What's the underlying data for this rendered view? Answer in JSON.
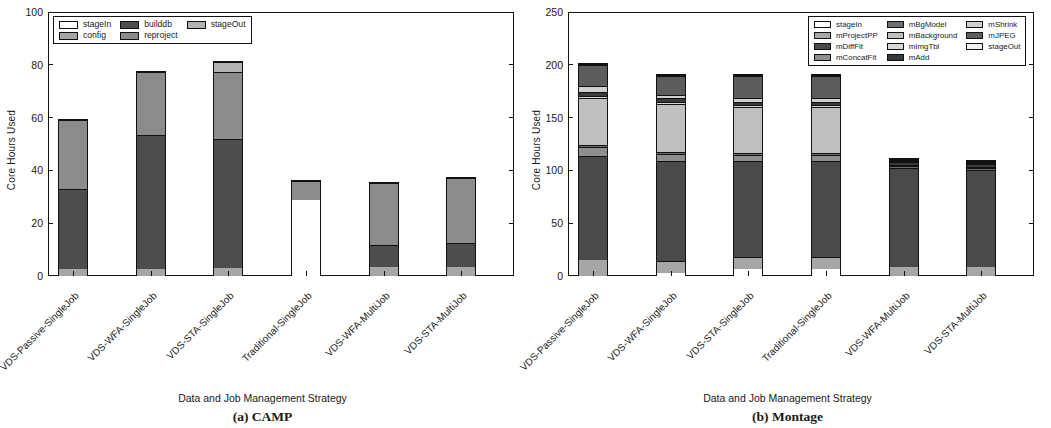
{
  "figure": {
    "panels": [
      {
        "caption": "(a) CAMP",
        "ylabel": "Core Hours Used",
        "xlabel": "Data and Job Management Strategy",
        "yticks": [
          "0",
          "20",
          "40",
          "60",
          "80",
          "100"
        ]
      },
      {
        "caption": "(b) Montage",
        "ylabel": "Core Hours Used",
        "xlabel": "Data and Job Management Strategy",
        "yticks": [
          "0",
          "50",
          "100",
          "150",
          "200",
          "250"
        ]
      }
    ]
  },
  "chart_data": [
    {
      "type": "bar",
      "title": "(a) CAMP",
      "stacked": true,
      "xlabel": "Data and Job Management Strategy",
      "ylabel": "Core Hours Used",
      "ylim": [
        0,
        100
      ],
      "yticks": [
        0,
        20,
        40,
        60,
        80,
        100
      ],
      "grid": false,
      "legend_position": "upper-left",
      "categories": [
        "VDS-Passive-SingleJob",
        "VDS-WFA-SingleJob",
        "VDS-STA-SingleJob",
        "Traditional-SingleJob",
        "VDS-WFA-MultiJob",
        "VDS-STA-MultiJob"
      ],
      "series": [
        {
          "name": "stageIn",
          "color": "#ffffff",
          "values": [
            0.0,
            0.0,
            0.0,
            29.0,
            0.0,
            0.0
          ]
        },
        {
          "name": "config",
          "color": "#a6a6a6",
          "values": [
            2.5,
            2.5,
            3.0,
            0.0,
            3.5,
            3.5
          ]
        },
        {
          "name": "builddb",
          "color": "#4d4d4d",
          "values": [
            30.5,
            51.0,
            49.0,
            0.0,
            8.5,
            9.0
          ]
        },
        {
          "name": "reproject",
          "color": "#8c8c8c",
          "values": [
            26.5,
            24.0,
            25.5,
            7.5,
            23.5,
            25.0
          ]
        },
        {
          "name": "stageOut",
          "color": "#b3b3b3",
          "values": [
            0.0,
            0.0,
            4.0,
            0.0,
            0.0,
            0.0
          ]
        }
      ],
      "extra_segments_note": "Traditional-SingleJob: stageIn 29, reproject 7.5, builddb 31.5, reproject 26.5, stageOut 4.5",
      "totals": [
        59.5,
        77.5,
        81.5,
        98.5,
        35.5,
        37.5
      ]
    },
    {
      "type": "bar",
      "title": "(b) Montage",
      "stacked": true,
      "xlabel": "Data and Job Management Strategy",
      "ylabel": "Core Hours Used",
      "ylim": [
        0,
        250
      ],
      "yticks": [
        0,
        50,
        100,
        150,
        200,
        250
      ],
      "grid": false,
      "legend_position": "upper-right",
      "categories": [
        "VDS-Passive-SingleJob",
        "VDS-WFA-SingleJob",
        "VDS-STA-SingleJob",
        "Traditional-SingleJob",
        "VDS-WFA-MultiJob",
        "VDS-STA-MultiJob"
      ],
      "series": [
        {
          "name": "stageIn",
          "color": "#ffffff",
          "values": [
            0.0,
            3.0,
            7.0,
            7.0,
            0.0,
            0.0
          ]
        },
        {
          "name": "mProjectPP",
          "color": "#a6a6a6",
          "values": [
            15.0,
            11.0,
            11.0,
            11.0,
            9.0,
            9.0
          ]
        },
        {
          "name": "mDiffFit",
          "color": "#4a4a4a",
          "values": [
            99.0,
            95.0,
            91.0,
            91.0,
            95.0,
            93.0
          ]
        },
        {
          "name": "mConcatFit",
          "color": "#8f8f8f",
          "values": [
            9.0,
            7.0,
            6.0,
            6.0,
            0.0,
            0.0
          ]
        },
        {
          "name": "mBgModel",
          "color": "#6e6e6e",
          "values": [
            2.0,
            2.0,
            2.0,
            2.0,
            1.5,
            1.5
          ]
        },
        {
          "name": "mBackground",
          "color": "#c0c0c0",
          "values": [
            44.0,
            46.0,
            44.0,
            44.0,
            0.0,
            0.0
          ]
        },
        {
          "name": "mImgTbl",
          "color": "#d8d8d8",
          "values": [
            2.0,
            2.0,
            2.0,
            2.0,
            1.0,
            1.0
          ]
        },
        {
          "name": "mAdd",
          "color": "#3a3a3a",
          "values": [
            4.0,
            3.0,
            3.0,
            3.0,
            2.5,
            2.5
          ]
        },
        {
          "name": "mShrink",
          "color": "#cfcfcf",
          "values": [
            6.0,
            3.0,
            3.0,
            3.0,
            1.5,
            1.5
          ]
        },
        {
          "name": "mJPEG",
          "color": "#5c5c5c",
          "values": [
            20.0,
            18.0,
            21.0,
            21.0,
            1.0,
            1.0
          ]
        },
        {
          "name": "stageOut",
          "color": "#f2f2f2",
          "values": [
            1.0,
            1.0,
            1.0,
            1.0,
            0.5,
            0.5
          ]
        }
      ],
      "totals": [
        202.0,
        188.0,
        190.0,
        190.0,
        112.0,
        110.0
      ]
    }
  ],
  "panel_a": {
    "legend": {
      "items": [
        {
          "label": "stageIn",
          "color": "#ffffff"
        },
        {
          "label": "builddb",
          "color": "#4d4d4d"
        },
        {
          "label": "stageOut",
          "color": "#b3b3b3"
        },
        {
          "label": "config",
          "color": "#a6a6a6"
        },
        {
          "label": "reproject",
          "color": "#8c8c8c"
        }
      ]
    }
  },
  "panel_b": {
    "legend": {
      "items": [
        {
          "label": "stageIn",
          "color": "#ffffff"
        },
        {
          "label": "mBgModel",
          "color": "#6e6e6e"
        },
        {
          "label": "mShrink",
          "color": "#cfcfcf"
        },
        {
          "label": "mProjectPP",
          "color": "#a6a6a6"
        },
        {
          "label": "mBackground",
          "color": "#c0c0c0"
        },
        {
          "label": "mJPEG",
          "color": "#5c5c5c"
        },
        {
          "label": "mDiffFit",
          "color": "#4a4a4a"
        },
        {
          "label": "mImgTbl",
          "color": "#d8d8d8"
        },
        {
          "label": "stageOut",
          "color": "#f2f2f2"
        },
        {
          "label": "mConcatFit",
          "color": "#8f8f8f"
        },
        {
          "label": "mAdd",
          "color": "#3a3a3a"
        }
      ]
    }
  }
}
